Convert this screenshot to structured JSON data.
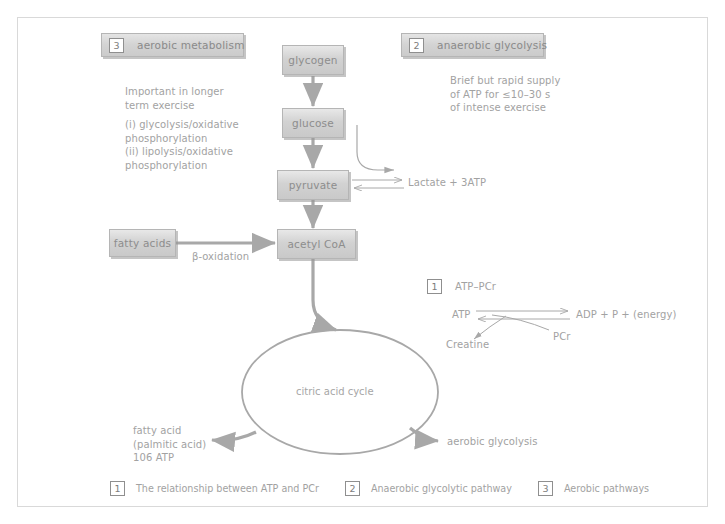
{
  "headers": [
    {
      "num": "3",
      "label": "aerobic metabolism"
    },
    {
      "num": "2",
      "label": "anaerobic glycolysis"
    }
  ],
  "notes": {
    "left": "Important in longer\nterm exercise",
    "left_items": "(i) glycolysis/oxidative\n    phosphorylation\n(ii) lipolysis/oxidative\n     phosphorylation",
    "right": "Brief but rapid supply\nof ATP for ≤10–30 s\nof intense exercise"
  },
  "nodes": {
    "glycogen": "glycogen",
    "glucose": "glucose",
    "pyruvate": "pyruvate",
    "acetyl_coa": "acetyl CoA",
    "fatty_acids": "fatty acids"
  },
  "labels": {
    "lactate": "Lactate + 3ATP",
    "beta_oxidation": "β-oxidation",
    "citric_acid_cycle": "citric acid cycle",
    "fatty_acid_output": "fatty acid\n(palmitic acid)\n106 ATP",
    "aerobic_glycolysis_output": "aerobic glycolysis"
  },
  "atp_pcr": {
    "num": "1",
    "title": "ATP–PCr",
    "atp": "ATP",
    "products": "ADP + P + (energy)",
    "pcr": "PCr",
    "creatine": "Creatine"
  },
  "legend": [
    {
      "num": "1",
      "label": "The relationship between ATP and PCr"
    },
    {
      "num": "2",
      "label": "Anaerobic glycolytic pathway"
    },
    {
      "num": "3",
      "label": "Aerobic pathways"
    }
  ],
  "colors": {
    "box_fill": "#d2d2d2",
    "box_border": "#b5b5b5",
    "text": "#a2a2a2",
    "arrow": "#a8a8a8",
    "panel_border": "#d9d9d9"
  }
}
